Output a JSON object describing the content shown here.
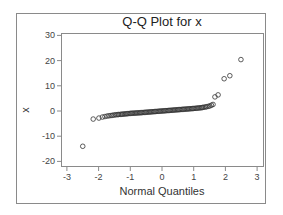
{
  "chart_data": {
    "type": "scatter",
    "title": "Q-Q Plot for x",
    "xlabel": "Normal Quantiles",
    "ylabel": "x",
    "xlim": [
      -3.15,
      3.2
    ],
    "ylim": [
      -22,
      31.5
    ],
    "x_ticks": [
      -3,
      -2,
      -1,
      0,
      1,
      2,
      3
    ],
    "y_ticks": [
      -20,
      -10,
      0,
      10,
      20,
      30
    ],
    "grid": false,
    "legend": null,
    "marker": "open-circle",
    "points": [
      [
        -2.5,
        -14.0
      ],
      [
        -2.17,
        -3.2
      ],
      [
        -1.99,
        -2.8
      ],
      [
        -1.88,
        -2.4
      ],
      [
        -1.8,
        -2.2
      ],
      [
        -1.73,
        -2.0
      ],
      [
        -1.67,
        -1.9
      ],
      [
        -1.61,
        -1.8
      ],
      [
        -1.56,
        -1.7
      ],
      [
        -1.51,
        -1.6
      ],
      [
        -1.46,
        -1.5
      ],
      [
        -1.41,
        -1.45
      ],
      [
        -1.37,
        -1.4
      ],
      [
        -1.32,
        -1.35
      ],
      [
        -1.28,
        -1.3
      ],
      [
        -1.24,
        -1.25
      ],
      [
        -1.2,
        -1.2
      ],
      [
        -1.16,
        -1.15
      ],
      [
        -1.12,
        -1.1
      ],
      [
        -1.08,
        -1.05
      ],
      [
        -1.04,
        -1.0
      ],
      [
        -1.0,
        -0.95
      ],
      [
        -0.96,
        -0.9
      ],
      [
        -0.92,
        -0.88
      ],
      [
        -0.88,
        -0.85
      ],
      [
        -0.84,
        -0.82
      ],
      [
        -0.8,
        -0.78
      ],
      [
        -0.76,
        -0.75
      ],
      [
        -0.72,
        -0.72
      ],
      [
        -0.68,
        -0.68
      ],
      [
        -0.64,
        -0.65
      ],
      [
        -0.6,
        -0.6
      ],
      [
        -0.56,
        -0.56
      ],
      [
        -0.52,
        -0.52
      ],
      [
        -0.48,
        -0.48
      ],
      [
        -0.44,
        -0.44
      ],
      [
        -0.4,
        -0.4
      ],
      [
        -0.36,
        -0.36
      ],
      [
        -0.32,
        -0.32
      ],
      [
        -0.28,
        -0.28
      ],
      [
        -0.24,
        -0.24
      ],
      [
        -0.2,
        -0.2
      ],
      [
        -0.16,
        -0.16
      ],
      [
        -0.12,
        -0.12
      ],
      [
        -0.08,
        -0.08
      ],
      [
        -0.04,
        -0.04
      ],
      [
        0.0,
        0.0
      ],
      [
        0.04,
        0.04
      ],
      [
        0.08,
        0.08
      ],
      [
        0.12,
        0.12
      ],
      [
        0.16,
        0.16
      ],
      [
        0.2,
        0.2
      ],
      [
        0.24,
        0.24
      ],
      [
        0.28,
        0.28
      ],
      [
        0.32,
        0.32
      ],
      [
        0.36,
        0.36
      ],
      [
        0.4,
        0.4
      ],
      [
        0.44,
        0.44
      ],
      [
        0.48,
        0.48
      ],
      [
        0.52,
        0.52
      ],
      [
        0.56,
        0.56
      ],
      [
        0.6,
        0.6
      ],
      [
        0.64,
        0.65
      ],
      [
        0.68,
        0.68
      ],
      [
        0.72,
        0.72
      ],
      [
        0.76,
        0.76
      ],
      [
        0.8,
        0.8
      ],
      [
        0.84,
        0.84
      ],
      [
        0.88,
        0.88
      ],
      [
        0.92,
        0.92
      ],
      [
        0.96,
        0.96
      ],
      [
        1.0,
        1.0
      ],
      [
        1.04,
        1.05
      ],
      [
        1.08,
        1.1
      ],
      [
        1.12,
        1.15
      ],
      [
        1.16,
        1.2
      ],
      [
        1.2,
        1.25
      ],
      [
        1.24,
        1.3
      ],
      [
        1.28,
        1.4
      ],
      [
        1.32,
        1.5
      ],
      [
        1.37,
        1.6
      ],
      [
        1.41,
        1.7
      ],
      [
        1.46,
        1.85
      ],
      [
        1.51,
        2.0
      ],
      [
        1.56,
        2.3
      ],
      [
        1.61,
        2.6
      ],
      [
        1.67,
        5.6
      ],
      [
        1.77,
        6.4
      ],
      [
        1.96,
        12.8
      ],
      [
        2.14,
        14.0
      ],
      [
        2.49,
        20.4
      ]
    ]
  },
  "colors": {
    "marker": "#333333",
    "axis": "#8a8a8a",
    "frame": "#8a8a8a",
    "text": "#333333"
  }
}
